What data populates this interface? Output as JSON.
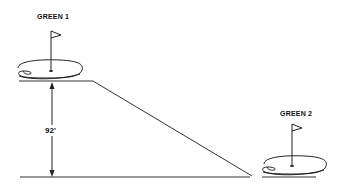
{
  "diagram": {
    "greens": [
      {
        "label": "GREEN 1"
      },
      {
        "label": "GREEN 2"
      }
    ],
    "elevation_label": "92'"
  }
}
